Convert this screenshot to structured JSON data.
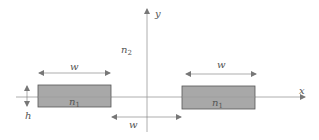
{
  "diagram": {
    "axes": {
      "x_label": "x",
      "y_label": "y"
    },
    "regions": {
      "outer_label": "n",
      "outer_sub": "2",
      "core_left_label": "n",
      "core_left_sub": "1",
      "core_right_label": "n",
      "core_right_sub": "1"
    },
    "dimensions": {
      "left_width_label": "w",
      "right_width_label": "w",
      "gap_label": "w",
      "height_label": "h"
    },
    "colors": {
      "core_fill": "#a8a8a8",
      "core_stroke": "#555555",
      "axis": "#888888",
      "text": "#555555"
    }
  }
}
